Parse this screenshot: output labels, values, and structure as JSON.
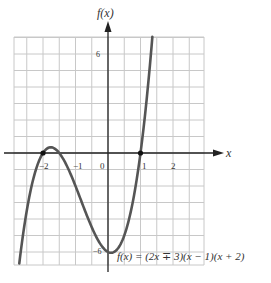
{
  "chart_data": {
    "type": "line",
    "title": "",
    "function": "f(x) = (2x + 3)(x - 1)(x + 2)",
    "xlabel": "x",
    "ylabel": "f(x)",
    "x_tick_labels": [
      "-2",
      "-1",
      "0",
      "1",
      "2"
    ],
    "y_tick_labels": [
      "6",
      "-6"
    ],
    "xlim": [
      -3,
      2.9
    ],
    "ylim": [
      -7,
      7
    ],
    "grid": true,
    "grid_step": {
      "x": 0.5,
      "y": 1
    },
    "roots_marked": [
      [
        -2,
        0
      ],
      [
        1,
        0
      ]
    ],
    "y_intercept": [
      0,
      -6
    ],
    "series": [
      {
        "name": "f(x)",
        "color": "#555555",
        "x": [
          -2.73,
          -2.5,
          -2.25,
          -2,
          -1.75,
          -1.5,
          -1.25,
          -1,
          -0.75,
          -0.5,
          -0.25,
          0,
          0.25,
          0.5,
          0.75,
          1,
          1.25,
          1.365
        ],
        "values": [
          -6.8,
          -3.5,
          -1.31,
          0,
          0.47,
          0,
          -1.31,
          -2.0,
          -3.94,
          -5.0,
          -5.86,
          -6.0,
          -5.63,
          -4.0,
          -1.41,
          0,
          4.39,
          7.0
        ]
      }
    ],
    "annotation": "f(x) = (2x ∓ 3)(x − 1)(x + 2)"
  },
  "labels": {
    "y_axis": "f(x)",
    "x_axis": "x",
    "tick_m2": "−2",
    "tick_m1": "−1",
    "tick_0": "0",
    "tick_1": "1",
    "tick_2": "2",
    "tick_y6": "6",
    "tick_ym6": "−6",
    "formula": "f(x) = (2x ∓ 3)(x − 1)(x + 2)"
  },
  "colors": {
    "grid": "#c8c8c8",
    "axis": "#222222",
    "curve": "#555555"
  }
}
